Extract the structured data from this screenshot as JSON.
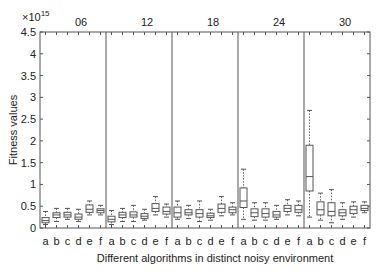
{
  "chart_data": {
    "type": "box",
    "title": "",
    "xlabel": "Different algorithms in distinct noisy environment",
    "ylabel": "Fitness values",
    "y_multiplier": "×10",
    "y_exponent": "15",
    "ylim": [
      0,
      4.5
    ],
    "yticks": [
      0,
      0.5,
      1,
      1.5,
      2,
      2.5,
      3,
      3.5,
      4,
      4.5
    ],
    "grid": false,
    "groups": [
      "06",
      "12",
      "18",
      "24",
      "30"
    ],
    "categories": [
      "a",
      "b",
      "c",
      "d",
      "e",
      "f"
    ],
    "series": [
      {
        "group": "06",
        "boxes": [
          {
            "cat": "a",
            "whislo": 0.08,
            "q1": 0.12,
            "med": 0.17,
            "q3": 0.24,
            "whishi": 0.38
          },
          {
            "cat": "b",
            "whislo": 0.15,
            "q1": 0.24,
            "med": 0.3,
            "q3": 0.35,
            "whishi": 0.45
          },
          {
            "cat": "c",
            "whislo": 0.2,
            "q1": 0.25,
            "med": 0.3,
            "q3": 0.36,
            "whishi": 0.45
          },
          {
            "cat": "d",
            "whislo": 0.15,
            "q1": 0.2,
            "med": 0.25,
            "q3": 0.32,
            "whishi": 0.43
          },
          {
            "cat": "e",
            "whislo": 0.3,
            "q1": 0.36,
            "med": 0.43,
            "q3": 0.53,
            "whishi": 0.62
          },
          {
            "cat": "f",
            "whislo": 0.3,
            "q1": 0.35,
            "med": 0.4,
            "q3": 0.44,
            "whishi": 0.52
          }
        ]
      },
      {
        "group": "12",
        "boxes": [
          {
            "cat": "a",
            "whislo": 0.08,
            "q1": 0.14,
            "med": 0.2,
            "q3": 0.27,
            "whishi": 0.4
          },
          {
            "cat": "b",
            "whislo": 0.15,
            "q1": 0.24,
            "med": 0.3,
            "q3": 0.36,
            "whishi": 0.45
          },
          {
            "cat": "c",
            "whislo": 0.15,
            "q1": 0.25,
            "med": 0.3,
            "q3": 0.37,
            "whishi": 0.52
          },
          {
            "cat": "d",
            "whislo": 0.18,
            "q1": 0.22,
            "med": 0.27,
            "q3": 0.33,
            "whishi": 0.43
          },
          {
            "cat": "e",
            "whislo": 0.3,
            "q1": 0.38,
            "med": 0.45,
            "q3": 0.56,
            "whishi": 0.72
          },
          {
            "cat": "f",
            "whislo": 0.25,
            "q1": 0.32,
            "med": 0.38,
            "q3": 0.48,
            "whishi": 0.55
          }
        ]
      },
      {
        "group": "18",
        "boxes": [
          {
            "cat": "a",
            "whislo": 0.2,
            "q1": 0.25,
            "med": 0.35,
            "q3": 0.48,
            "whishi": 0.62
          },
          {
            "cat": "b",
            "whislo": 0.22,
            "q1": 0.3,
            "med": 0.35,
            "q3": 0.42,
            "whishi": 0.52
          },
          {
            "cat": "c",
            "whislo": 0.15,
            "q1": 0.25,
            "med": 0.33,
            "q3": 0.42,
            "whishi": 0.62
          },
          {
            "cat": "d",
            "whislo": 0.18,
            "q1": 0.24,
            "med": 0.28,
            "q3": 0.34,
            "whishi": 0.43
          },
          {
            "cat": "e",
            "whislo": 0.28,
            "q1": 0.36,
            "med": 0.45,
            "q3": 0.55,
            "whishi": 0.72
          },
          {
            "cat": "f",
            "whislo": 0.3,
            "q1": 0.35,
            "med": 0.42,
            "q3": 0.48,
            "whishi": 0.58
          }
        ]
      },
      {
        "group": "24",
        "boxes": [
          {
            "cat": "a",
            "whislo": 0.2,
            "q1": 0.47,
            "med": 0.62,
            "q3": 0.92,
            "whishi": 1.35
          },
          {
            "cat": "b",
            "whislo": 0.18,
            "q1": 0.26,
            "med": 0.35,
            "q3": 0.44,
            "whishi": 0.58
          },
          {
            "cat": "c",
            "whislo": 0.18,
            "q1": 0.25,
            "med": 0.33,
            "q3": 0.44,
            "whishi": 0.58
          },
          {
            "cat": "d",
            "whislo": 0.2,
            "q1": 0.25,
            "med": 0.3,
            "q3": 0.38,
            "whishi": 0.52
          },
          {
            "cat": "e",
            "whislo": 0.3,
            "q1": 0.38,
            "med": 0.45,
            "q3": 0.52,
            "whishi": 0.65
          },
          {
            "cat": "f",
            "whislo": 0.28,
            "q1": 0.36,
            "med": 0.42,
            "q3": 0.52,
            "whishi": 0.62
          }
        ]
      },
      {
        "group": "30",
        "boxes": [
          {
            "cat": "a",
            "whislo": 0.25,
            "q1": 0.85,
            "med": 1.18,
            "q3": 1.9,
            "whishi": 2.7
          },
          {
            "cat": "b",
            "whislo": 0.18,
            "q1": 0.3,
            "med": 0.42,
            "q3": 0.6,
            "whishi": 0.8
          },
          {
            "cat": "c",
            "whislo": 0.12,
            "q1": 0.28,
            "med": 0.38,
            "q3": 0.58,
            "whishi": 0.88
          },
          {
            "cat": "d",
            "whislo": 0.2,
            "q1": 0.28,
            "med": 0.35,
            "q3": 0.42,
            "whishi": 0.58
          },
          {
            "cat": "e",
            "whislo": 0.25,
            "q1": 0.33,
            "med": 0.42,
            "q3": 0.5,
            "whishi": 0.6
          },
          {
            "cat": "f",
            "whislo": 0.35,
            "q1": 0.4,
            "med": 0.45,
            "q3": 0.52,
            "whishi": 0.6
          }
        ]
      }
    ]
  }
}
